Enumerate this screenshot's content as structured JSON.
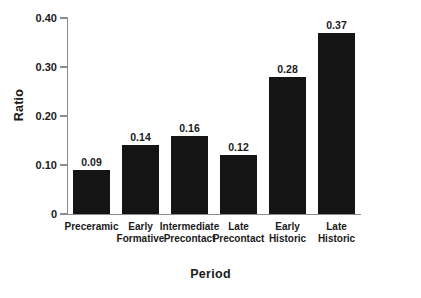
{
  "chart_data": {
    "type": "bar",
    "title": "",
    "xlabel": "Period",
    "ylabel": "Ratio",
    "categories": [
      "Preceramic",
      "Early Formative",
      "Intermediate Precontact",
      "Late Precontact",
      "Early Historic",
      "Late Historic"
    ],
    "category_lines": [
      [
        "Preceramic"
      ],
      [
        "Early",
        "Formative"
      ],
      [
        "Intermediate",
        "Precontact"
      ],
      [
        "Late",
        "Precontact"
      ],
      [
        "Early",
        "Historic"
      ],
      [
        "Late",
        "Historic"
      ]
    ],
    "values": [
      0.09,
      0.14,
      0.16,
      0.12,
      0.28,
      0.37
    ],
    "value_labels": [
      "0.09",
      "0.14",
      "0.16",
      "0.12",
      "0.28",
      "0.37"
    ],
    "ylim": [
      0,
      0.4
    ],
    "yticks": [
      0,
      0.1,
      0.2,
      0.3,
      0.4
    ],
    "ytick_labels": [
      "0",
      "0.10",
      "0.20",
      "0.30",
      "0.40"
    ],
    "grid": false,
    "legend": false,
    "bar_color": "#141414",
    "axis_color": "#8c8c8c",
    "text_color": "#1a1a1a",
    "background": "#ffffff"
  }
}
